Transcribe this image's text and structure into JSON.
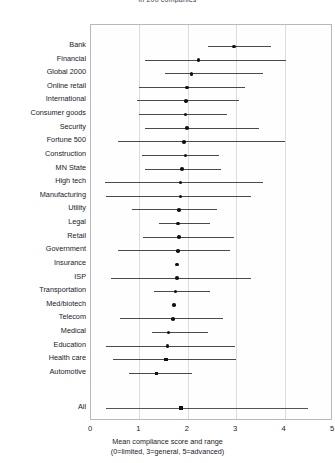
{
  "chart_data": {
    "type": "scatter",
    "title": "in 200 companies",
    "xlabel": "Mean compliance score and range",
    "xlabel_note": "(0=limited, 3=general, 5=advanced)",
    "ylabel": "",
    "xlim": [
      0,
      5
    ],
    "xticks": [
      0,
      1,
      2,
      3,
      4,
      5
    ],
    "xtick_labels": [
      "0",
      "1",
      "2",
      "3",
      "4",
      "5"
    ],
    "grid": true,
    "legend": "none",
    "point_color": "#111111",
    "range_color": "#4a4a4a",
    "categories": [
      "Bank",
      "Financial",
      "Global 2000",
      "Online retail",
      "International",
      "Consumer goods",
      "Security",
      "Fortune 500",
      "Construction",
      "MN State",
      "High tech",
      "Manufacturing",
      "Utility",
      "Legal",
      "Retail",
      "Government",
      "Insurance",
      "ISP",
      "Transportation",
      "Med/biotech",
      "Telecom",
      "Medical",
      "Education",
      "Health care",
      "Automotive",
      "All"
    ],
    "points": [
      {
        "label": "Bank",
        "mean": 2.95,
        "low": 2.42,
        "high": 3.72
      },
      {
        "label": "Financial",
        "mean": 2.22,
        "low": 1.12,
        "high": 4.02
      },
      {
        "label": "Global 2000",
        "mean": 2.08,
        "low": 1.52,
        "high": 3.55
      },
      {
        "label": "Online retail",
        "mean": 1.98,
        "low": 1.0,
        "high": 3.18
      },
      {
        "label": "International",
        "mean": 1.96,
        "low": 0.95,
        "high": 3.05
      },
      {
        "label": "Consumer goods",
        "mean": 1.95,
        "low": 1.0,
        "high": 2.82
      },
      {
        "label": "Security",
        "mean": 1.98,
        "low": 1.12,
        "high": 3.48
      },
      {
        "label": "Fortune 500",
        "mean": 1.92,
        "low": 0.55,
        "high": 4.0
      },
      {
        "label": "Construction",
        "mean": 1.95,
        "low": 1.05,
        "high": 2.65
      },
      {
        "label": "MN State",
        "mean": 1.88,
        "low": 1.12,
        "high": 2.68
      },
      {
        "label": "High tech",
        "mean": 1.85,
        "low": 0.28,
        "high": 3.55
      },
      {
        "label": "Manufacturing",
        "mean": 1.85,
        "low": 0.3,
        "high": 3.3
      },
      {
        "label": "Utility",
        "mean": 1.82,
        "low": 0.85,
        "high": 2.6
      },
      {
        "label": "Legal",
        "mean": 1.8,
        "low": 1.4,
        "high": 2.45
      },
      {
        "label": "Retail",
        "mean": 1.82,
        "low": 1.08,
        "high": 2.95
      },
      {
        "label": "Government",
        "mean": 1.8,
        "low": 0.55,
        "high": 2.88
      },
      {
        "label": "Insurance",
        "mean": 1.78,
        "low": 1.78,
        "high": 1.78
      },
      {
        "label": "ISP",
        "mean": 1.78,
        "low": 0.42,
        "high": 3.3
      },
      {
        "label": "Transportation",
        "mean": 1.75,
        "low": 1.3,
        "high": 2.45
      },
      {
        "label": "Med/biotech",
        "mean": 1.72,
        "low": 1.72,
        "high": 1.72
      },
      {
        "label": "Telecom",
        "mean": 1.7,
        "low": 0.6,
        "high": 2.72
      },
      {
        "label": "Medical",
        "mean": 1.6,
        "low": 1.25,
        "high": 2.42
      },
      {
        "label": "Education",
        "mean": 1.58,
        "low": 0.3,
        "high": 2.98
      },
      {
        "label": "Health care",
        "mean": 1.55,
        "low": 0.45,
        "high": 3.0
      },
      {
        "label": "Automotive",
        "mean": 1.35,
        "low": 0.78,
        "high": 2.08
      },
      {
        "label": "All",
        "mean": 1.86,
        "low": 0.3,
        "high": 4.48
      }
    ],
    "highlighted": [
      "Automotive",
      "Health care",
      "All"
    ]
  }
}
